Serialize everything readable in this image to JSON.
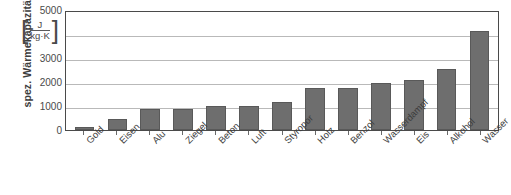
{
  "chart_data": {
    "type": "bar",
    "title": "",
    "xlabel": "",
    "ylabel": "spez. Wärmekapazität",
    "unit": {
      "open_bracket": "[",
      "numerator": "J",
      "denominator": "kg·K",
      "close_bracket": "]"
    },
    "ylim": [
      0,
      5000
    ],
    "yticks": [
      0,
      1000,
      2000,
      3000,
      5000
    ],
    "ytick_labels": [
      "0",
      "1000",
      "2000",
      "3000",
      "5000"
    ],
    "grid": true,
    "legend": "none",
    "categories": [
      "Gold",
      "Eisen",
      "Alu",
      "Ziegel",
      "Beton",
      "Luft",
      "Styropor",
      "Holz",
      "Benzol",
      "Wasserdampf",
      "Eis",
      "Alkohol",
      "Wasser"
    ],
    "values": [
      130,
      450,
      900,
      900,
      1000,
      1000,
      1200,
      1800,
      1800,
      2000,
      2100,
      2600,
      4200
    ],
    "bar_color": "#6e6e6e",
    "grid_color": "#b9b9b9",
    "axis_color": "#4a4a4a"
  }
}
